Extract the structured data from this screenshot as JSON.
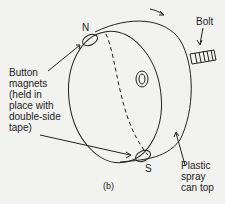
{
  "figure": {
    "caption": "(b)",
    "labels": {
      "north": "N",
      "south": "S",
      "bolt": "Bolt",
      "magnets": "Button\nmagnets\n(held in\nplace with\ndouble-side\ntape)",
      "cap": "Plastic\nspray\ncan top"
    },
    "colors": {
      "line": "#222222",
      "background": "#f2f2f0"
    }
  }
}
